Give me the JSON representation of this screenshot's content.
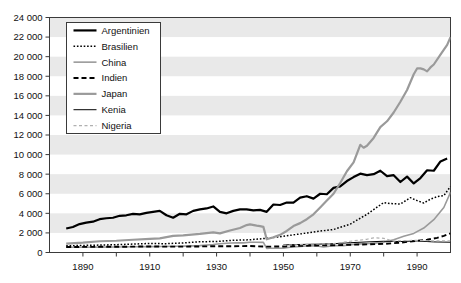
{
  "chart_data": {
    "type": "line",
    "title": "",
    "xlabel": "",
    "ylabel": "",
    "xlim": [
      1880,
      2000
    ],
    "ylim": [
      0,
      24000
    ],
    "ytick_step": 2000,
    "yticks": [
      0,
      2000,
      4000,
      6000,
      8000,
      10000,
      12000,
      14000,
      16000,
      18000,
      20000,
      22000,
      24000
    ],
    "ytick_labels": [
      "0",
      "2 000",
      "4 000",
      "6 000",
      "8 000",
      "10 000",
      "12 000",
      "14 000",
      "16 000",
      "18 000",
      "20 000",
      "22 000",
      "24 000"
    ],
    "xticks": [
      1890,
      1910,
      1930,
      1950,
      1970,
      1990
    ],
    "xtick_labels": [
      "1890",
      "1910",
      "1930",
      "1950",
      "1970",
      "1990"
    ],
    "xminor_ticks": [
      1880,
      1900,
      1920,
      1940,
      1960,
      1980,
      2000
    ],
    "grid": false,
    "banded_background": true,
    "band_color": "#e9e9e9",
    "legend_position": "top-left",
    "series": [
      {
        "name": "Argentinien",
        "style": "solid-thick",
        "color": "#000000",
        "width": 2.2,
        "dash": "",
        "x": [
          1885,
          1887,
          1889,
          1891,
          1893,
          1895,
          1897,
          1899,
          1901,
          1903,
          1905,
          1907,
          1909,
          1911,
          1913,
          1915,
          1917,
          1919,
          1921,
          1923,
          1925,
          1927,
          1929,
          1931,
          1933,
          1935,
          1937,
          1939,
          1941,
          1943,
          1945,
          1947,
          1949,
          1951,
          1953,
          1955,
          1957,
          1959,
          1961,
          1963,
          1965,
          1967,
          1969,
          1971,
          1973,
          1975,
          1977,
          1979,
          1981,
          1983,
          1985,
          1987,
          1989,
          1991,
          1993,
          1995,
          1997,
          1999
        ],
        "y": [
          2450,
          2600,
          2900,
          3050,
          3150,
          3400,
          3500,
          3550,
          3750,
          3800,
          3950,
          3900,
          4050,
          4150,
          4250,
          3800,
          3550,
          3950,
          3900,
          4250,
          4400,
          4500,
          4700,
          4150,
          4000,
          4250,
          4400,
          4400,
          4300,
          4350,
          4150,
          4900,
          4850,
          5100,
          5100,
          5600,
          5750,
          5500,
          6000,
          5950,
          6600,
          6750,
          7300,
          7700,
          8050,
          7900,
          8000,
          8350,
          7800,
          7900,
          7200,
          7750,
          7050,
          7600,
          8400,
          8350,
          9300,
          9600
        ]
      },
      {
        "name": "Brasilien",
        "style": "dotted",
        "color": "#000000",
        "width": 1.5,
        "dash": "1.6 1.8",
        "x": [
          1885,
          1890,
          1895,
          1900,
          1905,
          1910,
          1915,
          1920,
          1925,
          1930,
          1935,
          1940,
          1945,
          1950,
          1955,
          1960,
          1965,
          1970,
          1975,
          1980,
          1982,
          1985,
          1988,
          1990,
          1992,
          1994,
          1996,
          1998,
          2000
        ],
        "y": [
          680,
          720,
          760,
          800,
          860,
          920,
          900,
          980,
          1100,
          1120,
          1250,
          1300,
          1450,
          1650,
          1900,
          2150,
          2350,
          2900,
          3900,
          5100,
          5000,
          4950,
          5600,
          5300,
          5050,
          5450,
          5700,
          5800,
          6750
        ]
      },
      {
        "name": "China",
        "style": "solid-gray-thin",
        "color": "#9a9a9a",
        "width": 1.6,
        "dash": "",
        "x": [
          1885,
          1890,
          1895,
          1900,
          1905,
          1910,
          1913,
          1918,
          1920,
          1925,
          1929,
          1931,
          1933,
          1936,
          1938,
          1940,
          1942,
          1944,
          1945,
          1946,
          1948,
          1950,
          1952,
          1955,
          1958,
          1960,
          1962,
          1965,
          1968,
          1970,
          1973,
          1976,
          1978,
          1980,
          1983,
          1986,
          1989,
          1992,
          1995,
          1998,
          2000
        ],
        "y": [
          530,
          540,
          550,
          560,
          580,
          600,
          620,
          640,
          650,
          700,
          820,
          900,
          940,
          1000,
          980,
          1050,
          1050,
          1030,
          420,
          430,
          440,
          450,
          540,
          620,
          700,
          660,
          560,
          700,
          700,
          800,
          880,
          920,
          980,
          1050,
          1300,
          1650,
          1950,
          2500,
          3350,
          4600,
          6150
        ]
      },
      {
        "name": "Indien",
        "style": "dashed",
        "color": "#000000",
        "width": 1.9,
        "dash": "5 3",
        "x": [
          1885,
          1890,
          1895,
          1900,
          1905,
          1910,
          1915,
          1920,
          1925,
          1930,
          1935,
          1940,
          1945,
          1950,
          1955,
          1960,
          1965,
          1970,
          1975,
          1980,
          1985,
          1990,
          1993,
          1996,
          1998,
          2000
        ],
        "y": [
          560,
          570,
          580,
          580,
          600,
          620,
          600,
          600,
          620,
          640,
          640,
          660,
          600,
          620,
          680,
          720,
          740,
          790,
          830,
          880,
          1000,
          1200,
          1300,
          1500,
          1700,
          1950
        ]
      },
      {
        "name": "Japan",
        "style": "solid-gray-thick",
        "color": "#9a9a9a",
        "width": 2.2,
        "dash": "",
        "x": [
          1885,
          1890,
          1895,
          1900,
          1905,
          1910,
          1913,
          1917,
          1920,
          1925,
          1929,
          1931,
          1934,
          1937,
          1939,
          1940,
          1942,
          1943,
          1944,
          1945,
          1946,
          1947,
          1949,
          1951,
          1953,
          1955,
          1957,
          1959,
          1961,
          1963,
          1965,
          1967,
          1969,
          1971,
          1973,
          1974,
          1975,
          1977,
          1979,
          1981,
          1983,
          1985,
          1987,
          1989,
          1990,
          1991,
          1992,
          1993,
          1994,
          1995,
          1997,
          1999,
          2000
        ],
        "y": [
          900,
          1000,
          1150,
          1200,
          1300,
          1400,
          1450,
          1700,
          1750,
          1900,
          2050,
          1950,
          2250,
          2500,
          2800,
          2870,
          2750,
          2700,
          2620,
          1350,
          1450,
          1550,
          1800,
          2200,
          2700,
          3000,
          3400,
          3900,
          4600,
          5300,
          6000,
          7100,
          8300,
          9200,
          11000,
          10700,
          10900,
          11700,
          12800,
          13400,
          14300,
          15400,
          16600,
          18200,
          18800,
          18800,
          18700,
          18500,
          18900,
          19200,
          20200,
          21200,
          22000
        ]
      },
      {
        "name": "Kenia",
        "style": "solid-thin",
        "color": "#000000",
        "width": 1.0,
        "dash": "",
        "x": [
          1950,
          1955,
          1960,
          1965,
          1970,
          1975,
          1980,
          1985,
          1990,
          1995,
          2000
        ],
        "y": [
          780,
          820,
          850,
          900,
          1000,
          1080,
          1150,
          1120,
          1180,
          1080,
          1050
        ]
      },
      {
        "name": "Nigeria",
        "style": "dashed-gray",
        "color": "#b0b0b0",
        "width": 1.2,
        "dash": "3 2.5",
        "x": [
          1950,
          1955,
          1960,
          1965,
          1970,
          1975,
          1977,
          1980,
          1983,
          1985,
          1990,
          1995,
          2000
        ],
        "y": [
          750,
          800,
          870,
          900,
          1150,
          1350,
          1500,
          1450,
          1150,
          1200,
          1250,
          1180,
          1200
        ]
      }
    ]
  }
}
